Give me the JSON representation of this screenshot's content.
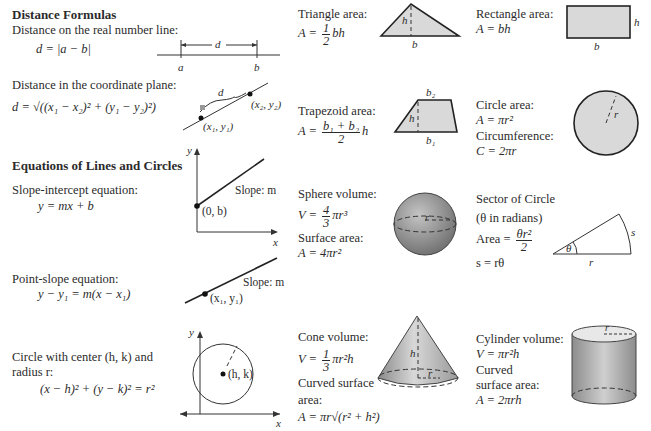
{
  "distance": {
    "heading": "Distance Formulas",
    "real_line_label": "Distance on the real number line:",
    "real_line_formula": "d = |a − b|",
    "real_line_diagram": {
      "d": "d",
      "a": "a",
      "b": "b"
    },
    "plane_label": "Distance in the coordinate plane:",
    "plane_formula": "d = √((x₁ − x₂)² + (y₁ − y₂)²)",
    "plane_diagram": {
      "d": "d",
      "p2": "(x₂, y₂)",
      "p1": "(x₁, y₁)"
    }
  },
  "lines": {
    "heading": "Equations of Lines and Circles",
    "slope_intercept_label": "Slope-intercept equation:",
    "slope_intercept_formula": "y = mx + b",
    "slope_intercept_diagram": {
      "y": "y",
      "x": "x",
      "slope": "Slope: m",
      "point": "(0, b)"
    },
    "point_slope_label": "Point-slope equation:",
    "point_slope_formula": "y − y₁ = m(x − x₁)",
    "point_slope_diagram": {
      "slope": "Slope: m",
      "point": "(x₁, y₁)"
    },
    "circle_label_1": "Circle with center (h, k) and",
    "circle_label_2": "radius r:",
    "circle_formula": "(x − h)² + (y − k)² = r²",
    "circle_diagram": {
      "y": "y",
      "x": "x",
      "center": "(h, k)"
    }
  },
  "shapes": {
    "triangle": {
      "label": "Triangle area:",
      "lhs": "A =",
      "num": "1",
      "den": "2",
      "rhs": "bh",
      "h": "h",
      "b": "b"
    },
    "rectangle": {
      "label": "Rectangle area:",
      "formula": "A = bh",
      "h": "h",
      "b": "b"
    },
    "trapezoid": {
      "label": "Trapezoid area:",
      "lhs": "A =",
      "num": "b₁ + b₂",
      "den": "2",
      "rhs": "h",
      "b1": "b₁",
      "b2": "b₂",
      "h": "h"
    },
    "circle": {
      "area_label": "Circle area:",
      "area_formula": "A = πr²",
      "circ_label": "Circumference:",
      "circ_formula": "C = 2πr",
      "r": "r"
    },
    "sphere": {
      "label": "Sphere volume:",
      "lhs": "V =",
      "num": "4",
      "den": "3",
      "rhs": "πr³",
      "surface_label": "Surface area:",
      "surface_formula": "A = 4πr²",
      "r": "r"
    },
    "sector": {
      "title": "Sector of Circle",
      "note": "(θ in radians)",
      "area_lhs": "Area =",
      "num": "θr²",
      "den": "2",
      "arc_formula": "s = rθ",
      "theta": "θ",
      "s": "s",
      "r": "r"
    },
    "cone": {
      "label": "Cone volume:",
      "lhs": "V =",
      "num": "1",
      "den": "3",
      "rhs": "πr²h",
      "surface_label_1": "Curved surface",
      "surface_label_2": "area:",
      "surface_formula": "A = πr√(r² + h²)",
      "h": "h",
      "r": "r"
    },
    "cylinder": {
      "label": "Cylinder volume:",
      "formula": "V = πr²h",
      "surface_label_1": "Curved",
      "surface_label_2": "surface area:",
      "surface_formula": "A = 2πrh",
      "r": "r"
    }
  }
}
